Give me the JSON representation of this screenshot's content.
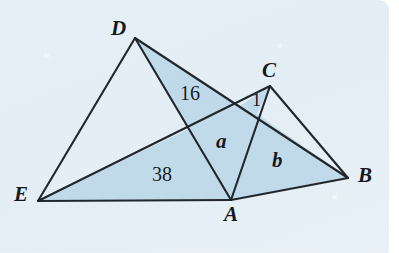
{
  "figure": {
    "background_color": "#e4eff6",
    "stroke_color": "#20262c",
    "shade_color": "#bed8e9",
    "vertices": [
      {
        "name": "D",
        "label": "D",
        "x": 135,
        "y": 38,
        "label_x": 111,
        "label_y": 18
      },
      {
        "name": "C",
        "label": "C",
        "x": 270,
        "y": 86,
        "label_x": 262,
        "label_y": 60
      },
      {
        "name": "E",
        "label": "E",
        "x": 38,
        "y": 201,
        "label_x": 14,
        "label_y": 184
      },
      {
        "name": "A",
        "label": "A",
        "x": 231,
        "y": 200,
        "label_x": 224,
        "label_y": 204
      },
      {
        "name": "B",
        "label": "B",
        "x": 348,
        "y": 178,
        "label_x": 358,
        "label_y": 165
      }
    ],
    "intersections": [
      {
        "name": "P-EC-DA",
        "x": 189,
        "y": 129
      },
      {
        "name": "P-EC-DB",
        "x": 240,
        "y": 106
      },
      {
        "name": "P-AC-DB",
        "x": 257,
        "y": 114
      }
    ],
    "edges": [
      {
        "name": "edge-D-E",
        "from": "D",
        "to": "E"
      },
      {
        "name": "edge-D-A",
        "from": "D",
        "to": "A"
      },
      {
        "name": "edge-D-B",
        "from": "D",
        "to": "B"
      },
      {
        "name": "edge-E-A",
        "from": "E",
        "to": "A"
      },
      {
        "name": "edge-E-C",
        "from": "E",
        "to": "C"
      },
      {
        "name": "edge-A-C",
        "from": "A",
        "to": "C"
      },
      {
        "name": "edge-A-B",
        "from": "A",
        "to": "B"
      },
      {
        "name": "edge-C-B",
        "from": "C",
        "to": "B"
      }
    ],
    "region_labels": [
      {
        "name": "region-label-16",
        "text": "16",
        "x": 180,
        "y": 83,
        "style": "num"
      },
      {
        "name": "region-label-1",
        "text": "1",
        "x": 252,
        "y": 91,
        "style": "one"
      },
      {
        "name": "region-label-a",
        "text": "a",
        "x": 216,
        "y": 131,
        "style": "var"
      },
      {
        "name": "region-label-38",
        "text": "38",
        "x": 152,
        "y": 164,
        "style": "num"
      },
      {
        "name": "region-label-b",
        "text": "b",
        "x": 272,
        "y": 150,
        "style": "var"
      }
    ],
    "shaded_regions": [
      {
        "name": "shade-16",
        "points": "135,38 240,106 189,129"
      },
      {
        "name": "shade-38",
        "points": "38,201 231,200 189,129"
      },
      {
        "name": "shade-a",
        "points": "189,129 240,106 257,114 231,200"
      },
      {
        "name": "shade-b",
        "points": "231,200 257,114 348,178"
      },
      {
        "name": "shade-1",
        "points": "240,106 270,86 257,114"
      }
    ]
  }
}
